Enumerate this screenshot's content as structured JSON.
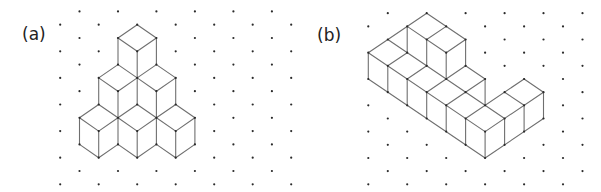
{
  "panels": [
    {
      "id": "a",
      "label": "(a)",
      "label_pos": [
        22,
        40
      ],
      "grid": {
        "x0": 60.2,
        "dx": 19.25,
        "y0": 11.4,
        "dy": 13.3,
        "cols": 13,
        "rows": 14,
        "dot_parity": "odd"
      },
      "edges": [
        [
          [
            4,
            1
          ],
          [
            3,
            2
          ]
        ],
        [
          [
            4,
            1
          ],
          [
            5,
            2
          ]
        ],
        [
          [
            3,
            2
          ],
          [
            4,
            3
          ]
        ],
        [
          [
            5,
            2
          ],
          [
            4,
            3
          ]
        ],
        [
          [
            3,
            2
          ],
          [
            3,
            4
          ]
        ],
        [
          [
            4,
            3
          ],
          [
            4,
            5
          ]
        ],
        [
          [
            5,
            2
          ],
          [
            5,
            4
          ]
        ],
        [
          [
            3,
            4
          ],
          [
            2,
            5
          ]
        ],
        [
          [
            3,
            4
          ],
          [
            4,
            5
          ]
        ],
        [
          [
            2,
            5
          ],
          [
            3,
            6
          ]
        ],
        [
          [
            3,
            6
          ],
          [
            4,
            5
          ]
        ],
        [
          [
            5,
            4
          ],
          [
            4,
            5
          ]
        ],
        [
          [
            5,
            4
          ],
          [
            6,
            5
          ]
        ],
        [
          [
            6,
            5
          ],
          [
            5,
            6
          ]
        ],
        [
          [
            5,
            6
          ],
          [
            4,
            5
          ]
        ],
        [
          [
            2,
            5
          ],
          [
            2,
            7
          ]
        ],
        [
          [
            3,
            6
          ],
          [
            3,
            8
          ]
        ],
        [
          [
            4,
            5
          ],
          [
            4,
            7
          ]
        ],
        [
          [
            5,
            6
          ],
          [
            5,
            8
          ]
        ],
        [
          [
            6,
            5
          ],
          [
            6,
            7
          ]
        ],
        [
          [
            2,
            7
          ],
          [
            1,
            8
          ]
        ],
        [
          [
            1,
            8
          ],
          [
            2,
            9
          ]
        ],
        [
          [
            2,
            9
          ],
          [
            3,
            8
          ]
        ],
        [
          [
            3,
            8
          ],
          [
            2,
            7
          ]
        ],
        [
          [
            3,
            8
          ],
          [
            4,
            7
          ]
        ],
        [
          [
            4,
            7
          ],
          [
            5,
            8
          ]
        ],
        [
          [
            5,
            8
          ],
          [
            4,
            9
          ]
        ],
        [
          [
            4,
            9
          ],
          [
            3,
            8
          ]
        ],
        [
          [
            5,
            8
          ],
          [
            6,
            7
          ]
        ],
        [
          [
            6,
            7
          ],
          [
            7,
            8
          ]
        ],
        [
          [
            7,
            8
          ],
          [
            6,
            9
          ]
        ],
        [
          [
            6,
            9
          ],
          [
            5,
            8
          ]
        ],
        [
          [
            1,
            8
          ],
          [
            1,
            10
          ]
        ],
        [
          [
            2,
            9
          ],
          [
            2,
            11
          ]
        ],
        [
          [
            3,
            8
          ],
          [
            3,
            10
          ]
        ],
        [
          [
            4,
            9
          ],
          [
            4,
            11
          ]
        ],
        [
          [
            5,
            8
          ],
          [
            5,
            10
          ]
        ],
        [
          [
            6,
            9
          ],
          [
            6,
            11
          ]
        ],
        [
          [
            7,
            8
          ],
          [
            7,
            10
          ]
        ],
        [
          [
            1,
            10
          ],
          [
            2,
            11
          ]
        ],
        [
          [
            2,
            11
          ],
          [
            3,
            10
          ]
        ],
        [
          [
            3,
            10
          ],
          [
            4,
            11
          ]
        ],
        [
          [
            4,
            11
          ],
          [
            5,
            10
          ]
        ],
        [
          [
            5,
            10
          ],
          [
            6,
            11
          ]
        ],
        [
          [
            6,
            11
          ],
          [
            7,
            10
          ]
        ]
      ]
    },
    {
      "id": "b",
      "label": "(b)",
      "label_pos": [
        317,
        41
      ],
      "grid": {
        "x0": 368.3,
        "dx": 19.47,
        "y0": 13.2,
        "dy": 13.16,
        "cols": 12,
        "rows": 14,
        "dot_parity": "odd"
      },
      "edges": [
        [
          [
            0,
            3
          ],
          [
            3,
            0
          ]
        ],
        [
          [
            3,
            0
          ],
          [
            5,
            2
          ]
        ],
        [
          [
            2,
            1
          ],
          [
            4,
            3
          ]
        ],
        [
          [
            4,
            1
          ],
          [
            3,
            2
          ]
        ],
        [
          [
            5,
            2
          ],
          [
            4,
            3
          ]
        ],
        [
          [
            2,
            1
          ],
          [
            2,
            3
          ]
        ],
        [
          [
            3,
            2
          ],
          [
            3,
            4
          ]
        ],
        [
          [
            4,
            3
          ],
          [
            4,
            5
          ]
        ],
        [
          [
            5,
            2
          ],
          [
            5,
            4
          ]
        ],
        [
          [
            1,
            2
          ],
          [
            7,
            8
          ]
        ],
        [
          [
            0,
            3
          ],
          [
            6,
            9
          ]
        ],
        [
          [
            1,
            4
          ],
          [
            2,
            3
          ]
        ],
        [
          [
            2,
            5
          ],
          [
            3,
            4
          ]
        ],
        [
          [
            3,
            6
          ],
          [
            5,
            4
          ]
        ],
        [
          [
            4,
            7
          ],
          [
            6,
            5
          ]
        ],
        [
          [
            5,
            8
          ],
          [
            8,
            5
          ]
        ],
        [
          [
            6,
            9
          ],
          [
            9,
            6
          ]
        ],
        [
          [
            5,
            4
          ],
          [
            6,
            5
          ]
        ],
        [
          [
            6,
            5
          ],
          [
            6,
            7
          ]
        ],
        [
          [
            7,
            6
          ],
          [
            8,
            7
          ]
        ],
        [
          [
            8,
            5
          ],
          [
            9,
            6
          ]
        ],
        [
          [
            0,
            3
          ],
          [
            0,
            5
          ]
        ],
        [
          [
            1,
            4
          ],
          [
            1,
            6
          ]
        ],
        [
          [
            2,
            5
          ],
          [
            2,
            7
          ]
        ],
        [
          [
            3,
            6
          ],
          [
            3,
            8
          ]
        ],
        [
          [
            4,
            7
          ],
          [
            4,
            9
          ]
        ],
        [
          [
            5,
            8
          ],
          [
            5,
            10
          ]
        ],
        [
          [
            6,
            9
          ],
          [
            6,
            11
          ]
        ],
        [
          [
            7,
            8
          ],
          [
            7,
            10
          ]
        ],
        [
          [
            8,
            7
          ],
          [
            8,
            9
          ]
        ],
        [
          [
            9,
            6
          ],
          [
            9,
            8
          ]
        ],
        [
          [
            0,
            5
          ],
          [
            6,
            11
          ]
        ],
        [
          [
            6,
            11
          ],
          [
            9,
            8
          ]
        ]
      ]
    }
  ]
}
